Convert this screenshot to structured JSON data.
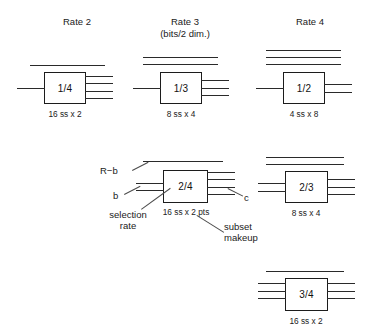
{
  "figure": {
    "columns": [
      {
        "title": "Rate 2",
        "subtitle": ""
      },
      {
        "title": "Rate 3",
        "subtitle": "(bits/2 dim.)"
      },
      {
        "title": "Rate 4",
        "subtitle": ""
      }
    ],
    "boxes": [
      {
        "label": "1/4",
        "caption": "16 ss x 2",
        "lines_above": 1,
        "lines_left": 1,
        "lines_right": 4
      },
      {
        "label": "1/3",
        "caption": "8 ss x 4",
        "lines_above": 2,
        "lines_left": 1,
        "lines_right": 3
      },
      {
        "label": "1/2",
        "caption": "4 ss x 8",
        "lines_above": 3,
        "lines_left": 1,
        "lines_right": 2
      },
      {
        "label": "2/4",
        "caption": "16 ss x 2 pts",
        "lines_above": 1,
        "lines_left": 2,
        "lines_right": 4
      },
      {
        "label": "2/3",
        "caption": "8 ss x 4",
        "lines_above": 2,
        "lines_left": 2,
        "lines_right": 3
      },
      {
        "label": "3/4",
        "caption": "16 ss x 2",
        "lines_above": 1,
        "lines_left": 3,
        "lines_right": 3
      }
    ],
    "annotations": {
      "r_minus_b": "R−b",
      "b": "b",
      "c": "c",
      "selection_rate": "selection\nrate",
      "selection_rate_line1": "selection",
      "selection_rate_line2": "rate",
      "subset_makeup_line1": "subset",
      "subset_makeup_line2": "makeup"
    },
    "colors": {
      "background": "#ffffff",
      "ink": "#1a1a1a",
      "box_border": "#1c1c1c",
      "wire": "#2a2a2a",
      "leader": "#4a4a4a"
    }
  }
}
